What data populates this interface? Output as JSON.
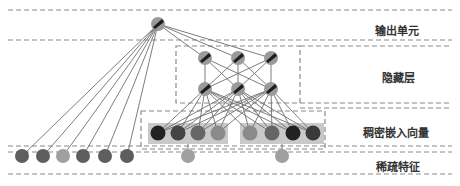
{
  "layers": {
    "output": {
      "label": "输出单元"
    },
    "hidden": {
      "label": "隐藏层"
    },
    "dense": {
      "label": "稠密嵌入向量"
    },
    "sparse": {
      "label": "稀疏特征"
    }
  },
  "colors": {
    "dash": "#8a8a8a",
    "edge": "#6e6e6e",
    "embed_bg": "#c9c9c9",
    "neuron_fill": "#9a9a9a",
    "neuron_mark": "#1e1e1e"
  },
  "nodes": {
    "output_unit": {
      "x": 158,
      "y": 24
    },
    "hidden_top": [
      {
        "x": 205,
        "y": 58
      },
      {
        "x": 238,
        "y": 58
      },
      {
        "x": 271,
        "y": 58
      }
    ],
    "hidden_bottom": [
      {
        "x": 205,
        "y": 89
      },
      {
        "x": 238,
        "y": 89
      },
      {
        "x": 271,
        "y": 89
      }
    ],
    "dense_group_1": [
      {
        "x": 158,
        "y": 133,
        "fill": "#222222"
      },
      {
        "x": 178,
        "y": 133,
        "fill": "#444444"
      },
      {
        "x": 198,
        "y": 133,
        "fill": "#666666"
      },
      {
        "x": 218,
        "y": 133,
        "fill": "#8a8a8a"
      }
    ],
    "dense_group_2": [
      {
        "x": 250,
        "y": 133,
        "fill": "#8a8a8a"
      },
      {
        "x": 272,
        "y": 133,
        "fill": "#666666"
      },
      {
        "x": 293,
        "y": 133,
        "fill": "#222222"
      },
      {
        "x": 313,
        "y": 133,
        "fill": "#3a3a3a"
      }
    ],
    "sparse_left": [
      {
        "x": 22,
        "y": 156,
        "fill": "#5e5e5e"
      },
      {
        "x": 43,
        "y": 156,
        "fill": "#5e5e5e"
      },
      {
        "x": 63,
        "y": 156,
        "fill": "#a0a0a0"
      },
      {
        "x": 83,
        "y": 156,
        "fill": "#5e5e5e"
      },
      {
        "x": 105,
        "y": 156,
        "fill": "#5e5e5e"
      },
      {
        "x": 127,
        "y": 156,
        "fill": "#5e5e5e"
      }
    ],
    "sparse_mid": [
      {
        "x": 188,
        "y": 156,
        "fill": "#a0a0a0"
      },
      {
        "x": 282,
        "y": 156,
        "fill": "#a0a0a0"
      }
    ]
  }
}
